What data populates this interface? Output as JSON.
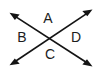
{
  "figure": {
    "background_color": "#ffffff",
    "stroke_color": "#141414",
    "label_color": "#1c1c1c",
    "width": 101,
    "height": 73,
    "intersection": {
      "x": 50,
      "y": 37
    }
  },
  "labels": {
    "top": "A",
    "left": "B",
    "bottom": "C",
    "right": "D"
  },
  "label_positions": {
    "top": {
      "x": 48,
      "y": 19
    },
    "left": {
      "x": 22,
      "y": 38
    },
    "bottom": {
      "x": 50,
      "y": 55
    },
    "right": {
      "x": 76,
      "y": 38
    }
  },
  "lines": [
    {
      "name": "line-nw-se",
      "from": {
        "x": 10,
        "y": 13
      },
      "to": {
        "x": 92,
        "y": 66
      },
      "arrowheads": [
        "start",
        "end"
      ]
    },
    {
      "name": "line-sw-ne",
      "from": {
        "x": 10,
        "y": 65
      },
      "to": {
        "x": 92,
        "y": 10
      },
      "arrowheads": [
        "start",
        "end"
      ]
    }
  ]
}
